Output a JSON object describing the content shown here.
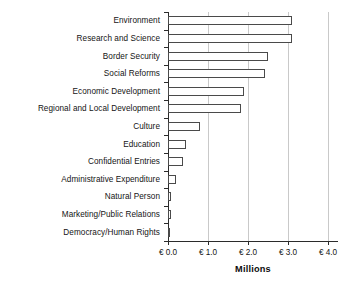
{
  "chart_data": {
    "type": "bar",
    "orientation": "horizontal",
    "title": "",
    "xlabel": "Millions",
    "ylabel": "",
    "categories": [
      "Environment",
      "Research and Science",
      "Border Security",
      "Social Reforms",
      "Economic Development",
      "Regional and Local Development",
      "Culture",
      "Education",
      "Confidential Entries",
      "Administrative Expenditure",
      "Natural Person",
      "Marketing/Public Relations",
      "Democracy/Human Rights"
    ],
    "values": [
      3.1,
      3.1,
      2.5,
      2.43,
      1.9,
      1.82,
      0.8,
      0.45,
      0.37,
      0.2,
      0.07,
      0.07,
      0.01
    ],
    "xlim": [
      0.0,
      4.0
    ],
    "xticks": [
      0.0,
      1.0,
      2.0,
      3.0,
      4.0
    ],
    "xtick_labels": [
      "€ 0.0",
      "€ 1.0",
      "€ 2.0",
      "€ 3.0",
      "€ 4.0"
    ],
    "grid": "vertical",
    "legend": null,
    "bar_fill_color": "#ffffff",
    "bar_edge_color": "#4a4a4a",
    "gridline_color": "#c9c9c9",
    "axis_color": "#2b2b2b",
    "background_color": "#ffffff"
  }
}
